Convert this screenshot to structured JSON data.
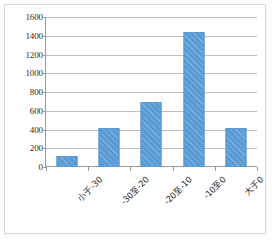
{
  "chart_data": {
    "type": "bar",
    "title": "",
    "xlabel": "",
    "ylabel": "",
    "categories": [
      "小于-30",
      "-30至-20",
      "-20至-10",
      "-10至0",
      "大于0"
    ],
    "values": [
      120,
      420,
      690,
      1440,
      420
    ],
    "series": [
      {
        "name": "频数",
        "values": [
          120,
          420,
          690,
          1440,
          420
        ],
        "color": "#5b9bd5"
      }
    ],
    "ylim": [
      0,
      1600
    ],
    "ytick_values": [
      0,
      200,
      400,
      600,
      800,
      1000,
      1200,
      1400,
      1600
    ],
    "ytick_labels": [
      "0",
      "200",
      "400",
      "600",
      "800",
      "1000",
      "1200",
      "1400",
      "1600"
    ],
    "grid": "horizontal",
    "legend": "none",
    "bar_color": "#5b9bd5",
    "gridline_color": "#bfbfbf",
    "axis_color": "#9a9a9a",
    "plot_background": "#ffffff",
    "border_color": "#d8d8d8",
    "xtick_label_rotation": -45
  }
}
